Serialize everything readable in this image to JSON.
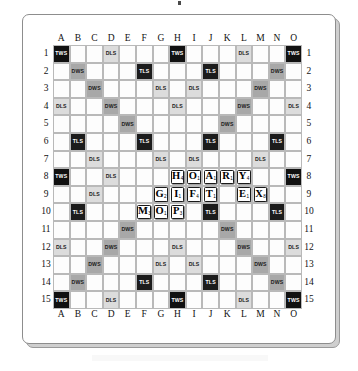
{
  "board": {
    "title": "Scrabble Board",
    "size": 15,
    "column_labels": [
      "A",
      "B",
      "C",
      "D",
      "E",
      "F",
      "G",
      "H",
      "I",
      "J",
      "K",
      "L",
      "M",
      "N",
      "O"
    ],
    "row_labels": [
      "1",
      "2",
      "3",
      "4",
      "5",
      "6",
      "7",
      "8",
      "9",
      "10",
      "11",
      "12",
      "13",
      "14",
      "15"
    ],
    "premium_legend": {
      "TWS": "Triple Word Score",
      "DWS": "Double Word Score",
      "TLS": "Triple Letter Score",
      "DLS": "Double Letter Score"
    },
    "colors": {
      "tws": "#111111",
      "tls": "#1c1c1c",
      "dws": "#a8a8a8",
      "dls": "#dcdcdc",
      "empty": "#fdfdfd",
      "grid_line": "#b9b9b9",
      "tile_face": "#ffffff",
      "tile_border": "#1a1a1a"
    },
    "premium_squares": [
      [
        "tws",
        "",
        "",
        "dls",
        "",
        "",
        "",
        "tws",
        "",
        "",
        "",
        "dls",
        "",
        "",
        "tws"
      ],
      [
        "",
        "dws",
        "",
        "",
        "",
        "tls",
        "",
        "",
        "",
        "tls",
        "",
        "",
        "",
        "dws",
        ""
      ],
      [
        "",
        "",
        "dws",
        "",
        "",
        "",
        "dls",
        "",
        "dls",
        "",
        "",
        "",
        "dws",
        "",
        ""
      ],
      [
        "dls",
        "",
        "",
        "dws",
        "",
        "",
        "",
        "dls",
        "",
        "",
        "",
        "dws",
        "",
        "",
        "dls"
      ],
      [
        "",
        "",
        "",
        "",
        "dws",
        "",
        "",
        "",
        "",
        "",
        "dws",
        "",
        "",
        "",
        ""
      ],
      [
        "",
        "tls",
        "",
        "",
        "",
        "tls",
        "",
        "",
        "",
        "tls",
        "",
        "",
        "",
        "tls",
        ""
      ],
      [
        "",
        "",
        "dls",
        "",
        "",
        "",
        "dls",
        "",
        "dls",
        "",
        "",
        "",
        "dls",
        "",
        ""
      ],
      [
        "tws",
        "",
        "",
        "dls",
        "",
        "",
        "",
        "",
        "",
        "",
        "",
        "",
        "",
        "",
        "tws"
      ],
      [
        "",
        "",
        "dls",
        "",
        "",
        "",
        "",
        "",
        "",
        "",
        "",
        "",
        "dls",
        "",
        ""
      ],
      [
        "",
        "tls",
        "",
        "",
        "",
        "",
        "",
        "",
        "",
        "tls",
        "",
        "",
        "",
        "tls",
        ""
      ],
      [
        "",
        "",
        "",
        "",
        "dws",
        "",
        "",
        "",
        "",
        "",
        "dws",
        "",
        "",
        "",
        ""
      ],
      [
        "dls",
        "",
        "",
        "dws",
        "",
        "",
        "",
        "dls",
        "",
        "",
        "",
        "dws",
        "",
        "",
        "dls"
      ],
      [
        "",
        "",
        "dws",
        "",
        "",
        "",
        "dls",
        "",
        "dls",
        "",
        "",
        "",
        "dws",
        "",
        ""
      ],
      [
        "",
        "dws",
        "",
        "",
        "",
        "tls",
        "",
        "",
        "",
        "tls",
        "",
        "",
        "",
        "dws",
        ""
      ],
      [
        "tws",
        "",
        "",
        "dls",
        "",
        "",
        "",
        "tws",
        "",
        "",
        "",
        "dls",
        "",
        "",
        "tws"
      ]
    ],
    "tiles": [
      {
        "row": 8,
        "col": "H",
        "letter": "H",
        "value": "4"
      },
      {
        "row": 8,
        "col": "I",
        "letter": "O",
        "value": "1"
      },
      {
        "row": 8,
        "col": "J",
        "letter": "A",
        "value": "1"
      },
      {
        "row": 8,
        "col": "K",
        "letter": "R",
        "value": "1"
      },
      {
        "row": 8,
        "col": "L",
        "letter": "Y",
        "value": "4"
      },
      {
        "row": 9,
        "col": "G",
        "letter": "G",
        "value": "2"
      },
      {
        "row": 9,
        "col": "H",
        "letter": "I",
        "value": "1"
      },
      {
        "row": 9,
        "col": "I",
        "letter": "F",
        "value": "4"
      },
      {
        "row": 9,
        "col": "J",
        "letter": "T",
        "value": "1"
      },
      {
        "row": 9,
        "col": "L",
        "letter": "E",
        "value": "1"
      },
      {
        "row": 9,
        "col": "M",
        "letter": "X",
        "value": "8"
      },
      {
        "row": 10,
        "col": "F",
        "letter": "M",
        "value": "3"
      },
      {
        "row": 10,
        "col": "G",
        "letter": "O",
        "value": "1"
      },
      {
        "row": 10,
        "col": "H",
        "letter": "P",
        "value": "3"
      }
    ],
    "words_on_board": [
      "HOARY",
      "GIFT",
      "MOP",
      "EX"
    ]
  }
}
